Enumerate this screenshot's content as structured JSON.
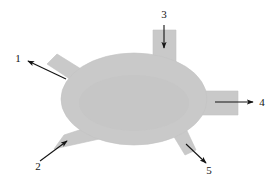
{
  "figure": {
    "background_color": "#ffffff",
    "body_fill_color": "#c9c9c9",
    "body_stroke_color": "#bdbdbd",
    "leader_color": "#141414",
    "label_color": "#141414",
    "width": 276,
    "height": 183
  },
  "shapes": {
    "central_body": {
      "name": "central-ellipse",
      "cx": 134,
      "cy": 99,
      "rx": 73,
      "ry": 46
    },
    "branches": [
      {
        "id": "branch-1",
        "name": "upper-left-branch",
        "direction": "up-left",
        "angle_deg": -152
      },
      {
        "id": "branch-2",
        "name": "lower-left-branch",
        "direction": "down-left",
        "angle_deg": 153
      },
      {
        "id": "branch-3",
        "name": "top-branch",
        "direction": "up",
        "angle_deg": -90
      },
      {
        "id": "branch-4",
        "name": "right-branch",
        "direction": "right",
        "angle_deg": 0
      },
      {
        "id": "branch-5",
        "name": "lower-right-branch",
        "direction": "down-right",
        "angle_deg": 62
      }
    ]
  },
  "callouts": [
    {
      "id": "callout-1",
      "label": "1",
      "label_x": 18,
      "label_y": 59,
      "arrow_from_x": 66,
      "arrow_from_y": 79,
      "arrow_to_x": 28,
      "arrow_to_y": 61,
      "points_to": "upper-left-branch"
    },
    {
      "id": "callout-2",
      "label": "2",
      "label_x": 38,
      "label_y": 167,
      "arrow_from_x": 40,
      "arrow_from_y": 161,
      "arrow_to_x": 67,
      "arrow_to_y": 141,
      "points_to": "lower-left-branch"
    },
    {
      "id": "callout-3",
      "label": "3",
      "label_x": 164,
      "label_y": 15,
      "arrow_from_x": 164,
      "arrow_from_y": 25,
      "arrow_to_x": 164,
      "arrow_to_y": 48,
      "points_to": "top-branch"
    },
    {
      "id": "callout-4",
      "label": "4",
      "label_x": 262,
      "label_y": 103,
      "arrow_from_x": 215,
      "arrow_from_y": 102,
      "arrow_to_x": 253,
      "arrow_to_y": 102,
      "points_to": "right-branch"
    },
    {
      "id": "callout-5",
      "label": "5",
      "label_x": 209,
      "label_y": 171,
      "arrow_from_x": 186,
      "arrow_from_y": 144,
      "arrow_to_x": 206,
      "arrow_to_y": 163,
      "points_to": "lower-right-branch"
    }
  ]
}
